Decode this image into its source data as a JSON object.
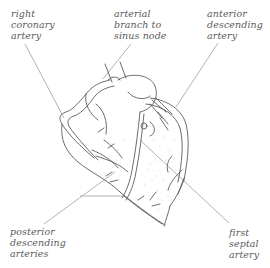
{
  "diagram": {
    "labels": {
      "right_coronary_artery": [
        "right",
        "coronary",
        "artery"
      ],
      "arterial_branch_sinus_node": [
        "arterial",
        "branch to",
        "sinus node"
      ],
      "anterior_descending_artery": [
        "anterior",
        "descending",
        "artery"
      ],
      "posterior_descending_arteries": [
        "posterior",
        "descending",
        "arteries"
      ],
      "first_septal_artery": [
        "first",
        "septal",
        "artery"
      ]
    },
    "colors": {
      "line": "#555555",
      "leader": "#9a9a9a",
      "text": "#5a5a5a",
      "stipple": "#b8b8b8"
    }
  }
}
